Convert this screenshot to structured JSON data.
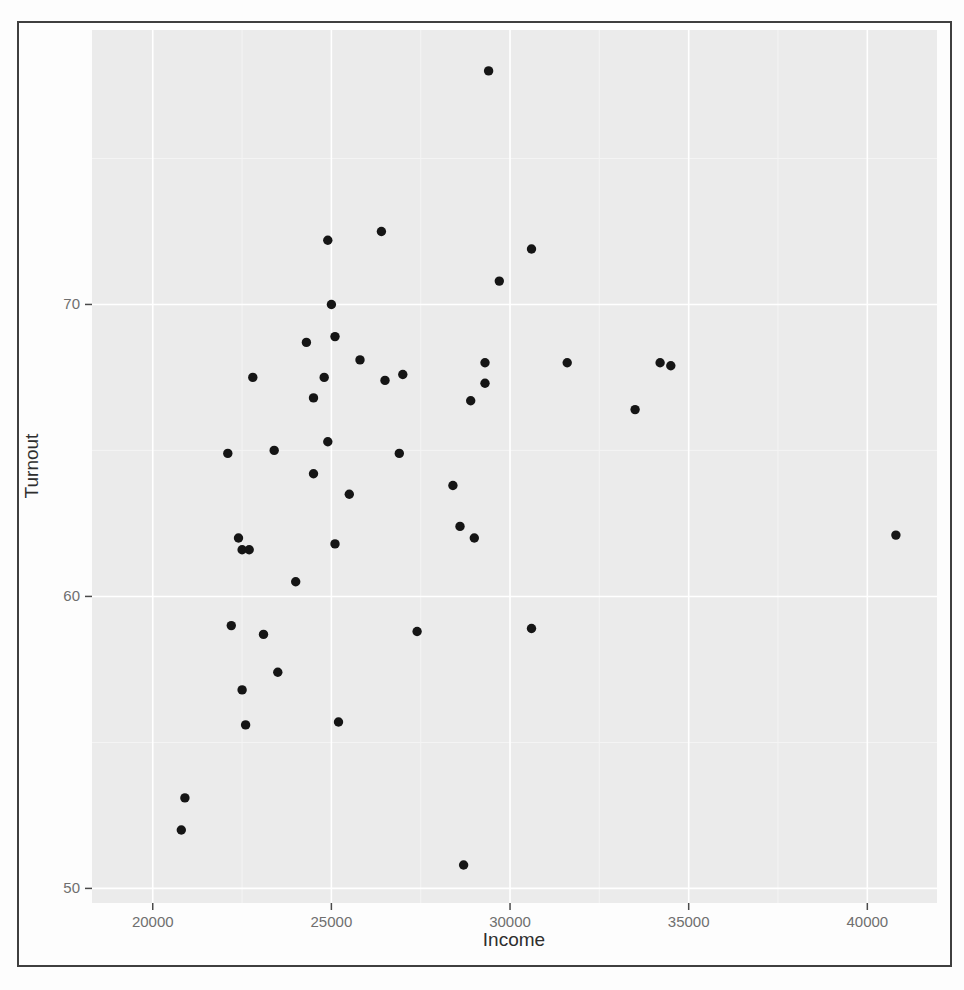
{
  "figure": {
    "frame_color": "#3f3f3f",
    "page_bg": "#fdfdfd"
  },
  "chart_data": {
    "type": "scatter",
    "title": "",
    "xlabel": "Income",
    "ylabel": "Turnout",
    "x_range": [
      18300,
      41950
    ],
    "y_range": [
      49.5,
      79.4
    ],
    "x_ticks": [
      20000,
      25000,
      30000,
      35000,
      40000
    ],
    "y_ticks": [
      50,
      60,
      70
    ],
    "x_minor_ticks": [
      22500,
      27500,
      32500,
      37500
    ],
    "y_minor_ticks": [
      55,
      65,
      75
    ],
    "grid": "major+minor",
    "legend": "none",
    "panel_bg": "#ebebeb",
    "major_grid_color": "#ffffff",
    "minor_grid_color": "#f4f4f4",
    "tick_mark_color": "#4a4a4a",
    "point_color": "#151515",
    "point_radius": 4.7,
    "points": [
      [
        29400,
        78.0
      ],
      [
        24900,
        72.2
      ],
      [
        26400,
        72.5
      ],
      [
        30600,
        71.9
      ],
      [
        29700,
        70.8
      ],
      [
        25000,
        70.0
      ],
      [
        25100,
        68.9
      ],
      [
        24300,
        68.7
      ],
      [
        25800,
        68.1
      ],
      [
        29300,
        68.0
      ],
      [
        31600,
        68.0
      ],
      [
        34200,
        68.0
      ],
      [
        34500,
        67.9
      ],
      [
        22800,
        67.5
      ],
      [
        24800,
        67.5
      ],
      [
        27000,
        67.6
      ],
      [
        26500,
        67.4
      ],
      [
        29300,
        67.3
      ],
      [
        33500,
        66.4
      ],
      [
        28900,
        66.7
      ],
      [
        24500,
        66.8
      ],
      [
        24900,
        65.3
      ],
      [
        23400,
        65.0
      ],
      [
        22100,
        64.9
      ],
      [
        26900,
        64.9
      ],
      [
        24500,
        64.2
      ],
      [
        25500,
        63.5
      ],
      [
        28400,
        63.8
      ],
      [
        28600,
        62.4
      ],
      [
        29000,
        62.0
      ],
      [
        22400,
        62.0
      ],
      [
        22500,
        61.6
      ],
      [
        22700,
        61.6
      ],
      [
        25100,
        61.8
      ],
      [
        40800,
        62.1
      ],
      [
        24000,
        60.5
      ],
      [
        22200,
        59.0
      ],
      [
        23100,
        58.7
      ],
      [
        27400,
        58.8
      ],
      [
        30600,
        58.9
      ],
      [
        23500,
        57.4
      ],
      [
        22500,
        56.8
      ],
      [
        22600,
        55.6
      ],
      [
        25200,
        55.7
      ],
      [
        20900,
        53.1
      ],
      [
        20800,
        52.0
      ],
      [
        28700,
        50.8
      ]
    ]
  }
}
